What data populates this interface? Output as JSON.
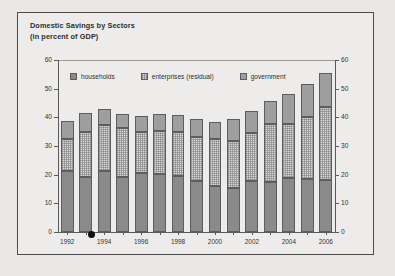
{
  "chart_data": {
    "type": "bar",
    "title": "Domestic Savings by Sectors",
    "subtitle": "(in percent of GDP)",
    "xlabel": "",
    "ylabel": "",
    "ylim": [
      0,
      60
    ],
    "yticks": [
      0,
      10,
      20,
      30,
      40,
      50,
      60
    ],
    "grid": false,
    "stacked": true,
    "legend_position": "top-inside",
    "dual_y_axis": true,
    "categories": [
      1992,
      1993,
      1994,
      1995,
      1996,
      1997,
      1998,
      1999,
      2000,
      2001,
      2002,
      2003,
      2004,
      2005,
      2006
    ],
    "xtick_labels": [
      "1992",
      "",
      "1994",
      "",
      "1996",
      "",
      "1998",
      "",
      "2000",
      "",
      "2002",
      "",
      "2004",
      "",
      "2006"
    ],
    "series": [
      {
        "name": "households",
        "color": "#8a8a8a",
        "values": [
          21.4,
          19.3,
          21.3,
          19.2,
          20.6,
          20.1,
          19.6,
          17.8,
          15.9,
          15.4,
          17.8,
          17.3,
          19.0,
          18.6,
          18.3
        ]
      },
      {
        "name": "enterprises (residual)",
        "color": "#dedede",
        "values": [
          11.2,
          15.6,
          16.1,
          17.0,
          14.3,
          15.2,
          15.3,
          15.3,
          16.4,
          16.4,
          16.9,
          20.4,
          18.6,
          21.5,
          25.4
        ]
      },
      {
        "name": "government",
        "color": "#9e9e9e",
        "values": [
          6.2,
          6.7,
          5.4,
          5.0,
          5.5,
          6.0,
          5.8,
          6.4,
          6.2,
          7.6,
          7.5,
          8.0,
          10.7,
          11.6,
          11.8
        ]
      }
    ],
    "totals": [
      38.8,
      41.6,
      42.8,
      41.2,
      40.4,
      41.3,
      40.7,
      39.5,
      38.5,
      39.4,
      42.2,
      45.7,
      48.3,
      51.7,
      55.5
    ]
  },
  "legend": {
    "items": [
      {
        "label": "households",
        "swatch": "households"
      },
      {
        "label": "enterprises (residual)",
        "swatch": "enterprises"
      },
      {
        "label": "government",
        "swatch": "government"
      }
    ]
  },
  "annotations": {
    "dot_marker": "black-dot-artifact"
  },
  "colors": {
    "background": "#e9e8e6",
    "panel": "#edecea",
    "frame": "#4b4b4b",
    "axis": "#5a5a5a",
    "text": "#2e2e2e"
  }
}
